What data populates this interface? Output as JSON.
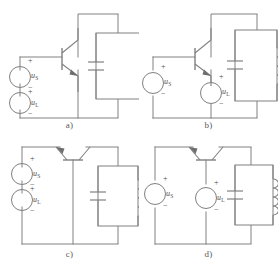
{
  "figure": {
    "type": "circuit-diagram",
    "background_color": "#ffffff",
    "line_color": "#808080",
    "text_color": "#4f4f4f"
  },
  "labels": {
    "source_s": "u",
    "source_s_sub": "S",
    "source_l": "u",
    "source_l_sub": "L",
    "plus": "+",
    "minus": "−"
  },
  "panels": [
    {
      "id": "a",
      "caption": "a)",
      "transistor": {
        "type": "npn",
        "orientation": "vertical",
        "arrow": "emitter-out"
      },
      "sources": [
        {
          "name": "uS",
          "label": "u",
          "sub": "S",
          "position": "left-upper",
          "polarity_top": "+",
          "polarity_bottom": "−"
        },
        {
          "name": "uL",
          "label": "u",
          "sub": "L",
          "position": "left-lower",
          "polarity_top": "+",
          "polarity_bottom": "−"
        }
      ],
      "tank": {
        "capacitor": true,
        "inductor": true,
        "inductor_loops": 4,
        "position": "right"
      }
    },
    {
      "id": "b",
      "caption": "b)",
      "transistor": {
        "type": "npn",
        "orientation": "vertical",
        "arrow": "emitter-out"
      },
      "sources": [
        {
          "name": "uS",
          "label": "u",
          "sub": "S",
          "position": "left-branch",
          "polarity_top": "+",
          "polarity_bottom": "−"
        },
        {
          "name": "uL",
          "label": "u",
          "sub": "L",
          "position": "middle-branch",
          "polarity_top": "+",
          "polarity_bottom": "−"
        }
      ],
      "tank": {
        "capacitor": true,
        "inductor": true,
        "inductor_loops": 4,
        "position": "right"
      }
    },
    {
      "id": "c",
      "caption": "c)",
      "transistor": {
        "type": "npn",
        "orientation": "horizontal-top",
        "arrow": "emitter-out"
      },
      "sources": [
        {
          "name": "uS",
          "label": "u",
          "sub": "S",
          "position": "left-upper",
          "polarity_top": "+",
          "polarity_bottom": "−"
        },
        {
          "name": "uL",
          "label": "u",
          "sub": "L",
          "position": "left-lower",
          "polarity_top": "+",
          "polarity_bottom": "−"
        }
      ],
      "tank": {
        "capacitor": true,
        "inductor": true,
        "inductor_loops": 4,
        "position": "right"
      }
    },
    {
      "id": "d",
      "caption": "d)",
      "transistor": {
        "type": "npn",
        "orientation": "horizontal-top",
        "arrow": "emitter-out"
      },
      "sources": [
        {
          "name": "uS",
          "label": "u",
          "sub": "S",
          "position": "left-branch",
          "polarity_top": "+",
          "polarity_bottom": "−"
        },
        {
          "name": "uL",
          "label": "u",
          "sub": "L",
          "position": "middle-branch",
          "polarity_top": "+",
          "polarity_bottom": "−"
        }
      ],
      "tank": {
        "capacitor": true,
        "inductor": true,
        "inductor_loops": 4,
        "position": "right"
      }
    }
  ]
}
